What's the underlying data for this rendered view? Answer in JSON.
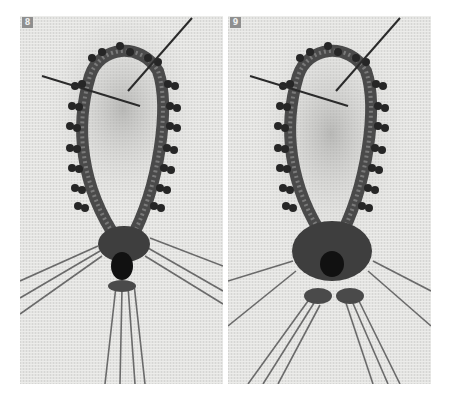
{
  "figure": {
    "panels": [
      {
        "step": "8",
        "caption_visible": false
      },
      {
        "step": "9",
        "caption_visible": false
      }
    ],
    "colors": {
      "canvas": "#e6e6e4",
      "beads": "#2a2a2a",
      "thread": "#5a5a5a",
      "badge": "#8f8f8f"
    }
  }
}
